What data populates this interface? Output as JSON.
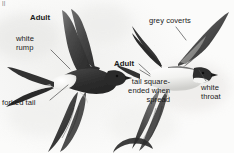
{
  "plate": {
    "width": 234,
    "height": 153,
    "background_color": "#f6f6f5",
    "subject": "house-martin-in-flight",
    "top_fragment": "ll"
  },
  "labels": {
    "adult_left": "Adult",
    "white_rump": "white\nrump",
    "forked_tail": "forked tail",
    "grey_coverts": "grey coverts",
    "adult_right": "Adult",
    "tail_square": "tail square-\nended when\nspread",
    "white_throat": "white\nthroat"
  },
  "colors": {
    "text": "#1b1b1b",
    "leader_line": "#4a4a4a",
    "plumage_dark": "#3a3a3a",
    "plumage_mid": "#6d6d6d",
    "plumage_light": "#f2f2f0",
    "background": "#f6f6f5"
  },
  "figures": [
    {
      "name": "upper-bird-left",
      "pose": "dorsal view, wings raised, banking left",
      "annotations": [
        "adult_left",
        "white_rump",
        "forked_tail"
      ]
    },
    {
      "name": "upper-bird-right",
      "pose": "ventral view, wings spread, tail fanned",
      "annotations": [
        "grey_coverts",
        "adult_right",
        "tail_square",
        "white_throat"
      ]
    }
  ]
}
